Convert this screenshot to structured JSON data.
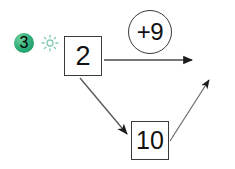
{
  "canvas": {
    "width": 235,
    "height": 169,
    "background": "#ffffff"
  },
  "diagram": {
    "type": "flow-diagram",
    "stroke_color": "#3a3a3a",
    "text_color": "#111111",
    "nodes": [
      {
        "id": "node-2",
        "shape": "square",
        "label": "2",
        "x": 64,
        "y": 36,
        "width": 38,
        "height": 40
      },
      {
        "id": "node-10",
        "shape": "square",
        "label": "10",
        "x": 131,
        "y": 121,
        "width": 38,
        "height": 39
      },
      {
        "id": "badge-circle",
        "shape": "circle",
        "label": "+9",
        "cx": 150,
        "cy": 32,
        "r": 21
      }
    ],
    "edges": [
      {
        "id": "edge-right",
        "from": "node-2",
        "to": "right-edge",
        "direction": "horizontal-right",
        "x1": 104,
        "y1": 60,
        "x2": 196,
        "y2": 60
      },
      {
        "id": "edge-down",
        "from": "node-2",
        "to": "node-10",
        "direction": "diagonal-down-right",
        "x1": 80,
        "y1": 78,
        "x2": 130,
        "y2": 137
      },
      {
        "id": "edge-up",
        "from": "node-10",
        "to": "upper-right",
        "direction": "diagonal-up-right",
        "x1": 170,
        "y1": 140,
        "x2": 212,
        "y2": 77
      }
    ]
  },
  "annotations": {
    "step_badge": {
      "label": "3",
      "color_start": "#6ecfa0",
      "color_end": "#13946 3",
      "accent": "#34b07a",
      "text_color": "#ffffff"
    },
    "sun_icon": {
      "name": "sun-icon",
      "color": "#7fc9b0"
    }
  }
}
